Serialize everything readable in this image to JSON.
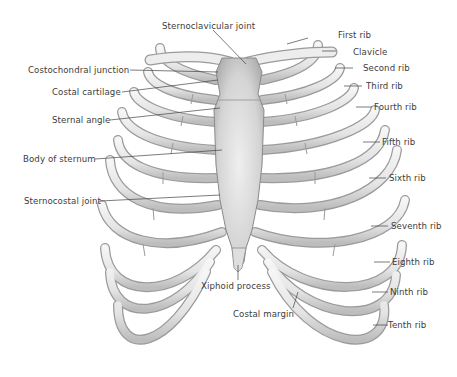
{
  "diagram": {
    "colors": {
      "background": "#ffffff",
      "bone_fill": "#ececec",
      "bone_shade": "#b8b8b8",
      "bone_outline": "#8a8a8a",
      "sternum_fill": "#d9d9d9",
      "label_text": "#3c3c3c",
      "leader_line": "#444444"
    },
    "labels": {
      "sternoclavicular_joint": "Sternoclavicular joint",
      "first_rib": "First rib",
      "clavicle": "Clavicle",
      "second_rib": "Second rib",
      "third_rib": "Third rib",
      "fourth_rib": "Fourth rib",
      "fifth_rib": "Fifth rib",
      "sixth_rib": "Sixth rib",
      "seventh_rib": "Seventh rib",
      "eighth_rib": "Eighth rib",
      "ninth_rib": "Ninth rib",
      "tenth_rib": "Tenth rib",
      "costochondral_junction": "Costochondral junction",
      "costal_cartilage": "Costal cartilage",
      "sternal_angle": "Sternal angle",
      "body_of_sternum": "Body of sternum",
      "sternocostal_joint": "Sternocostal joint",
      "xiphoid_process": "Xiphoid process",
      "costal_margin": "Costal margin"
    }
  }
}
